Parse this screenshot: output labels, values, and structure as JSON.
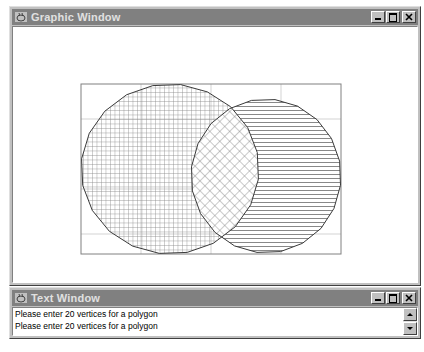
{
  "graphic_window": {
    "title": "Graphic Window",
    "icon": "java-cup-icon",
    "controls": [
      "minimize",
      "maximize",
      "close"
    ]
  },
  "canvas": {
    "clip_rectangle": {
      "x": 79,
      "y": 82,
      "width": 260,
      "height": 170
    },
    "polygons": [
      {
        "name": "polygon-a",
        "vertices": 20,
        "fill": "square-grid-hatch",
        "cx": 168,
        "cy": 167,
        "rx": 89,
        "ry": 85
      },
      {
        "name": "polygon-b",
        "vertices": 20,
        "fill": "horizontal-line-hatch",
        "cx": 264,
        "cy": 174,
        "rx": 75,
        "ry": 77
      }
    ],
    "intersection_fill": "diagonal-crosshatch",
    "colors": {
      "outline": "#404040",
      "hatch": "#8a8a8a",
      "grid": "#c8c8c8",
      "rect": "#808080"
    }
  },
  "text_window": {
    "title": "Text Window",
    "icon": "java-cup-icon",
    "controls": [
      "minimize",
      "maximize",
      "close"
    ],
    "lines": [
      "Please enter 20 vertices for a polygon",
      "Please enter 20 vertices for a polygon"
    ]
  }
}
